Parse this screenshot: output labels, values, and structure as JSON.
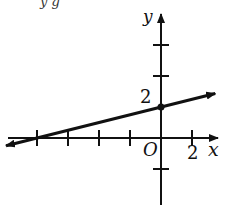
{
  "cropped_text": "y  g",
  "chart_data": {
    "type": "line",
    "title": "",
    "xlabel": "x",
    "ylabel": "y",
    "origin_label": "O",
    "tick_labels": {
      "x": [
        "2"
      ],
      "y": [
        "2"
      ]
    },
    "tick_unit": 2,
    "x_ticks": [
      -8,
      -6,
      -4,
      -2,
      2
    ],
    "y_ticks": [
      -2,
      4,
      6
    ],
    "xlim": [
      -10,
      3.5
    ],
    "ylim": [
      -4,
      8
    ],
    "grid": false,
    "series": [
      {
        "name": "line",
        "slope": 0.25,
        "y_intercept": 2,
        "x_intercept": -8,
        "x": [
          -10,
          3.5
        ],
        "y": [
          -0.5,
          2.875
        ],
        "marked_point": [
          0,
          2
        ],
        "arrows": "both"
      }
    ]
  }
}
